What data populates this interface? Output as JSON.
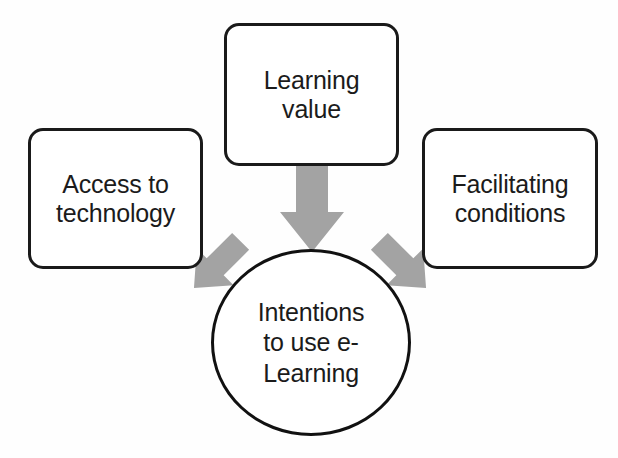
{
  "diagram": {
    "background_color": "#fefefe",
    "node_border_color": "#1a1a1a",
    "node_fill_color": "#ffffff",
    "arrow_color": "#a3a3a3",
    "text_color": "#1b1b1b",
    "nodes": [
      {
        "id": "access-to-technology",
        "label": "Access to\ntechnology",
        "shape": "rounded-rectangle"
      },
      {
        "id": "learning-value",
        "label": "Learning\nvalue",
        "shape": "rounded-rectangle"
      },
      {
        "id": "facilitating-conditions",
        "label": "Facilitating\nconditions",
        "shape": "rounded-rectangle"
      },
      {
        "id": "intentions-to-use-e-learning",
        "label": "Intentions\nto use e-\nLearning",
        "shape": "ellipse"
      }
    ],
    "arrows": [
      {
        "id": "learning-value-to-intentions",
        "from": "learning-value",
        "to": "intentions-to-use-e-learning",
        "direction": "down",
        "style": "block-arrow",
        "color": "#a3a3a3"
      },
      {
        "id": "access-to-intentions",
        "from": "access-to-technology",
        "to": "intentions-to-use-e-learning",
        "direction": "down-right",
        "style": "block-arrow",
        "color": "#a3a3a3"
      },
      {
        "id": "facilitating-to-intentions",
        "from": "facilitating-conditions",
        "to": "intentions-to-use-e-learning",
        "direction": "down-left",
        "style": "block-arrow",
        "color": "#a3a3a3"
      }
    ]
  }
}
